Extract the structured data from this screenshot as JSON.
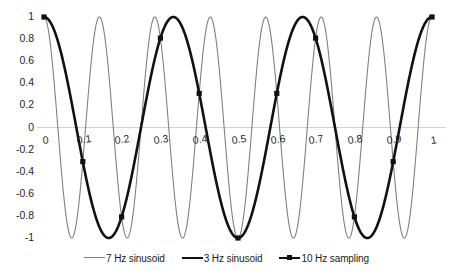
{
  "chart_data": {
    "type": "line",
    "title": "",
    "subtitle": "",
    "xlabel": "",
    "ylabel": "",
    "xlim": [
      0,
      1
    ],
    "ylim": [
      -1,
      1
    ],
    "grid": false,
    "zero_line": true,
    "legend_position": "bottom",
    "x_ticks": [
      "0",
      "0.1",
      "0.2",
      "0.3",
      "0.4",
      "0.5",
      "0.6",
      "0.7",
      "0.8",
      "0.9",
      "1"
    ],
    "x_tick_values": [
      0,
      0.1,
      0.2,
      0.3,
      0.4,
      0.5,
      0.6,
      0.7,
      0.8,
      0.9,
      1
    ],
    "y_ticks": [
      "1",
      "0.8",
      "0.6",
      "0.4",
      "0.2",
      "0",
      "-0.2",
      "-0.4",
      "-0.6",
      "-0.8",
      "-1"
    ],
    "y_tick_values": [
      1,
      0.8,
      0.6,
      0.4,
      0.2,
      0,
      -0.2,
      -0.4,
      -0.6,
      -0.8,
      -1
    ],
    "series": [
      {
        "name": "7 Hz sinusoid",
        "type": "line",
        "equation": "cos(2*pi*7*t)",
        "frequency_hz": 7,
        "color": "#808080",
        "width": 1.1,
        "markers": false
      },
      {
        "name": "3 Hz sinusoid",
        "type": "line",
        "equation": "cos(2*pi*3*t)",
        "frequency_hz": 3,
        "color": "#111111",
        "width": 2.6,
        "markers": false
      },
      {
        "name": "10 Hz sampling",
        "type": "scatter",
        "frequency_hz": 10,
        "color": "#111111",
        "markers": true,
        "x": [
          0,
          0.1,
          0.2,
          0.3,
          0.4,
          0.5,
          0.6,
          0.7,
          0.8,
          0.9,
          1
        ],
        "values": [
          1,
          -0.309,
          -0.809,
          0.809,
          0.309,
          -1,
          0.309,
          0.809,
          -0.809,
          -0.309,
          1
        ]
      }
    ],
    "legend": [
      {
        "label": "7 Hz sinusoid",
        "color": "#808080",
        "marker": false,
        "width": 1.3
      },
      {
        "label": "3 Hz sinusoid",
        "color": "#111111",
        "marker": false,
        "width": 2.8
      },
      {
        "label": "10 Hz sampling",
        "color": "#111111",
        "marker": true,
        "width": 2.0
      }
    ]
  }
}
